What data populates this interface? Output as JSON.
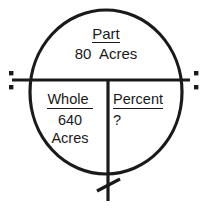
{
  "diagram": {
    "type": "percent-proportion-circle",
    "stroke_color": "#1a1a1a",
    "text_color": "#1a1a1a",
    "background_color": "#ffffff",
    "part": {
      "label": "Part",
      "value": "80  Acres"
    },
    "whole": {
      "label": "Whole ",
      "value": "640",
      "unit": "Acres"
    },
    "percent": {
      "label": "Percent",
      "value": "?"
    },
    "operators": {
      "divide_left": "divide-sign-left",
      "divide_right": "divide-sign-right",
      "multiply_bottom": "multiply-sign-bottom"
    },
    "geometry": {
      "circle_center_x": 106,
      "circle_center_y": 92,
      "circle_radius_x": 76,
      "circle_radius_y": 82,
      "horizontal_divider_y": 80,
      "vertical_divider_x": 108
    }
  }
}
